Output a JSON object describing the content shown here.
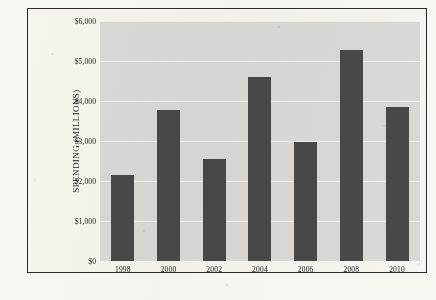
{
  "chart_data": {
    "type": "bar",
    "title": "",
    "subtitle": "",
    "xlabel": "",
    "ylabel": "SPENDING (MILLIONS)",
    "categories": [
      "1998",
      "2000",
      "2002",
      "2004",
      "2006",
      "2008",
      "2010"
    ],
    "values": [
      2150,
      3780,
      2550,
      4600,
      2980,
      5280,
      3840
    ],
    "series": [
      {
        "name": "Spending",
        "values": [
          2150,
          3780,
          2550,
          4600,
          2980,
          5280,
          3840
        ]
      }
    ],
    "ylim": [
      0,
      6000
    ],
    "y_tick_values": [
      0,
      1000,
      2000,
      3000,
      4000,
      5000,
      6000
    ],
    "y_tick_labels": [
      "$0",
      "$1,000",
      "$2,000",
      "$3,000",
      "$4,000",
      "$5,000",
      "$6,000"
    ],
    "grid": true,
    "legend": false,
    "legend_position": "none",
    "colors": {
      "bar": "#4a4a4a",
      "plot_background": "#dedede",
      "gridline": "#f4f4f4",
      "frame_border": "#2b2b2b",
      "page_background": "#fbfaf7",
      "text": "#1d1d1d"
    }
  }
}
